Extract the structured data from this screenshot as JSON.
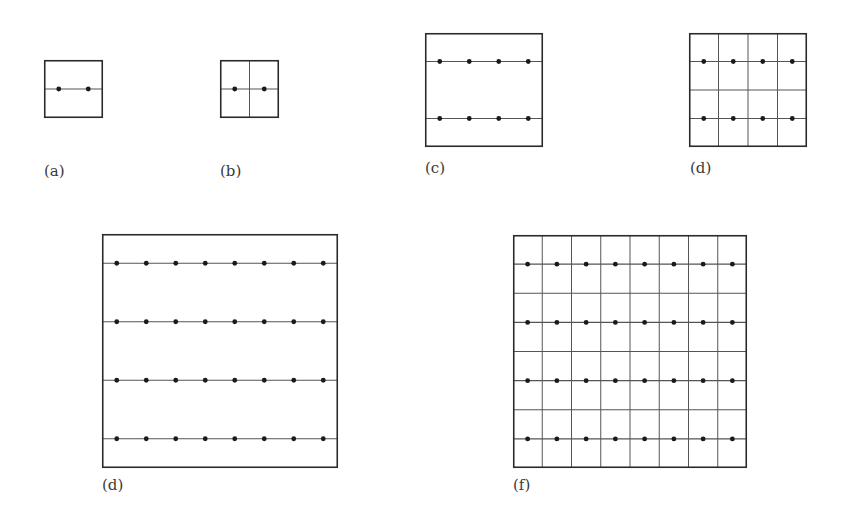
{
  "figure": {
    "panels": [
      {
        "id": "a",
        "label": "(a)",
        "box": {
          "x": 44,
          "y": 60,
          "w": 59,
          "h": 58
        },
        "dot_rows": 1,
        "dots_per_row": 2,
        "grid_cols": 1,
        "grid_rows": 1,
        "label_pos": {
          "x": 44,
          "y": 164
        }
      },
      {
        "id": "b",
        "label": "(b)",
        "box": {
          "x": 220,
          "y": 60,
          "w": 59,
          "h": 58
        },
        "dot_rows": 1,
        "dots_per_row": 2,
        "grid_cols": 2,
        "grid_rows": 1,
        "label_pos": {
          "x": 220,
          "y": 164
        }
      },
      {
        "id": "c",
        "label": "(c)",
        "box": {
          "x": 425,
          "y": 33,
          "w": 118,
          "h": 114
        },
        "dot_rows": 2,
        "dots_per_row": 4,
        "grid_cols": 1,
        "grid_rows": 1,
        "label_pos": {
          "x": 425,
          "y": 161
        }
      },
      {
        "id": "d1",
        "label": "(d)",
        "box": {
          "x": 689,
          "y": 33,
          "w": 118,
          "h": 114
        },
        "dot_rows": 2,
        "dots_per_row": 4,
        "grid_cols": 4,
        "grid_rows": 2,
        "label_pos": {
          "x": 690,
          "y": 161
        }
      },
      {
        "id": "d2",
        "label": "(d)",
        "box": {
          "x": 102,
          "y": 234,
          "w": 236,
          "h": 234
        },
        "dot_rows": 4,
        "dots_per_row": 8,
        "grid_cols": 1,
        "grid_rows": 1,
        "label_pos": {
          "x": 102,
          "y": 478
        }
      },
      {
        "id": "f",
        "label": "(f)",
        "box": {
          "x": 513,
          "y": 235,
          "w": 234,
          "h": 233
        },
        "dot_rows": 4,
        "dots_per_row": 8,
        "grid_cols": 8,
        "grid_rows": 4,
        "label_pos": {
          "x": 513,
          "y": 478
        }
      }
    ],
    "colors": {
      "border": "#2b2b2b",
      "line": "#555555",
      "dot": "#1a1a1a"
    }
  }
}
